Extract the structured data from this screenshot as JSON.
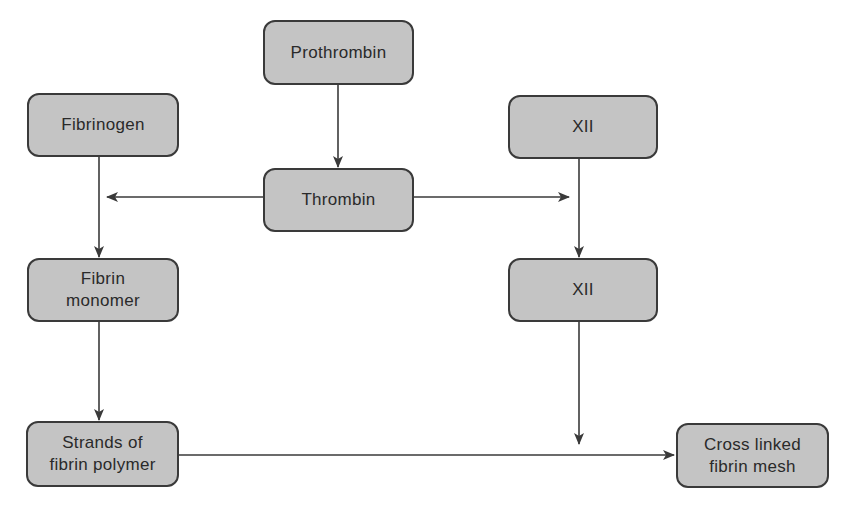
{
  "diagram": {
    "type": "flowchart",
    "colors": {
      "node_fill": "#c4c4c4",
      "node_border": "#3a3a3a",
      "edge": "#3a3a3a",
      "text": "#2a2a2a",
      "background": "#ffffff"
    },
    "nodes": [
      {
        "id": "prothrombin",
        "label": "Prothrombin",
        "x": 263,
        "y": 20,
        "w": 151,
        "h": 65
      },
      {
        "id": "thrombin",
        "label": "Thrombin",
        "x": 263,
        "y": 168,
        "w": 151,
        "h": 64
      },
      {
        "id": "fibrinogen",
        "label": "Fibrinogen",
        "x": 27,
        "y": 93,
        "w": 152,
        "h": 64
      },
      {
        "id": "fibrin_monomer",
        "label": "Fibrin\nmonomer",
        "x": 27,
        "y": 258,
        "w": 152,
        "h": 64
      },
      {
        "id": "fibrin_polymer",
        "label": "Strands of\nfibrin polymer",
        "x": 26,
        "y": 421,
        "w": 153,
        "h": 66
      },
      {
        "id": "xii_top",
        "label": "XII",
        "x": 508,
        "y": 95,
        "w": 150,
        "h": 64
      },
      {
        "id": "xii_bottom",
        "label": "XII",
        "x": 508,
        "y": 258,
        "w": 150,
        "h": 64
      },
      {
        "id": "cross_linked",
        "label": "Cross linked\nfibrin mesh",
        "x": 676,
        "y": 423,
        "w": 153,
        "h": 65
      }
    ],
    "edges": [
      {
        "id": "prothrombin-to-thrombin",
        "from": "prothrombin",
        "to": "thrombin",
        "x1": 338,
        "y1": 85,
        "x2": 338,
        "y2": 167
      },
      {
        "id": "thrombin-to-fibrinogen-path",
        "from": "thrombin",
        "to": "fibrinogen-to-monomer",
        "x1": 263,
        "y1": 197,
        "x2": 107,
        "y2": 197
      },
      {
        "id": "thrombin-to-xii-path",
        "from": "thrombin",
        "to": "xii-to-xii",
        "x1": 414,
        "y1": 197,
        "x2": 569,
        "y2": 197
      },
      {
        "id": "fibrinogen-to-monomer",
        "from": "fibrinogen",
        "to": "fibrin_monomer",
        "x1": 99,
        "y1": 157,
        "x2": 99,
        "y2": 257
      },
      {
        "id": "monomer-to-polymer",
        "from": "fibrin_monomer",
        "to": "fibrin_polymer",
        "x1": 99,
        "y1": 322,
        "x2": 99,
        "y2": 420
      },
      {
        "id": "xii-to-xii",
        "from": "xii_top",
        "to": "xii_bottom",
        "x1": 579,
        "y1": 159,
        "x2": 579,
        "y2": 257
      },
      {
        "id": "xii-to-mesh-path",
        "from": "xii_bottom",
        "to": "polymer-to-mesh",
        "x1": 579,
        "y1": 322,
        "x2": 579,
        "y2": 444
      },
      {
        "id": "polymer-to-mesh",
        "from": "fibrin_polymer",
        "to": "cross_linked",
        "x1": 179,
        "y1": 455,
        "x2": 674,
        "y2": 455
      }
    ]
  }
}
